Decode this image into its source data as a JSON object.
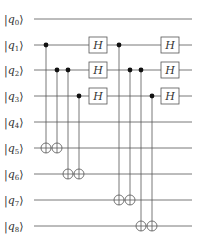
{
  "diagram": {
    "type": "quantum-circuit",
    "qubits": [
      {
        "label": "q",
        "index": "0",
        "y": 19
      },
      {
        "label": "q",
        "index": "1",
        "y": 45
      },
      {
        "label": "q",
        "index": "2",
        "y": 70
      },
      {
        "label": "q",
        "index": "3",
        "y": 96
      },
      {
        "label": "q",
        "index": "4",
        "y": 122
      },
      {
        "label": "q",
        "index": "5",
        "y": 148
      },
      {
        "label": "q",
        "index": "6",
        "y": 174
      },
      {
        "label": "q",
        "index": "7",
        "y": 200
      },
      {
        "label": "q",
        "index": "8",
        "y": 226
      }
    ],
    "gates": [
      {
        "type": "CNOT",
        "control": 1,
        "target": 5,
        "x": 46
      },
      {
        "type": "CNOT",
        "control": 2,
        "target": 5,
        "x": 57
      },
      {
        "type": "CNOT",
        "control": 2,
        "target": 6,
        "x": 68
      },
      {
        "type": "CNOT",
        "control": 3,
        "target": 6,
        "x": 79
      },
      {
        "type": "H",
        "qubit": 1,
        "x": 98,
        "label": "H"
      },
      {
        "type": "H",
        "qubit": 2,
        "x": 98,
        "label": "H"
      },
      {
        "type": "H",
        "qubit": 3,
        "x": 98,
        "label": "H"
      },
      {
        "type": "CNOT",
        "control": 1,
        "target": 7,
        "x": 119
      },
      {
        "type": "CNOT",
        "control": 2,
        "target": 7,
        "x": 130
      },
      {
        "type": "CNOT",
        "control": 2,
        "target": 8,
        "x": 141
      },
      {
        "type": "CNOT",
        "control": 3,
        "target": 8,
        "x": 152
      },
      {
        "type": "H",
        "qubit": 1,
        "x": 170,
        "label": "H"
      },
      {
        "type": "H",
        "qubit": 2,
        "x": 170,
        "label": "H"
      },
      {
        "type": "H",
        "qubit": 3,
        "x": 170,
        "label": "H"
      }
    ]
  }
}
